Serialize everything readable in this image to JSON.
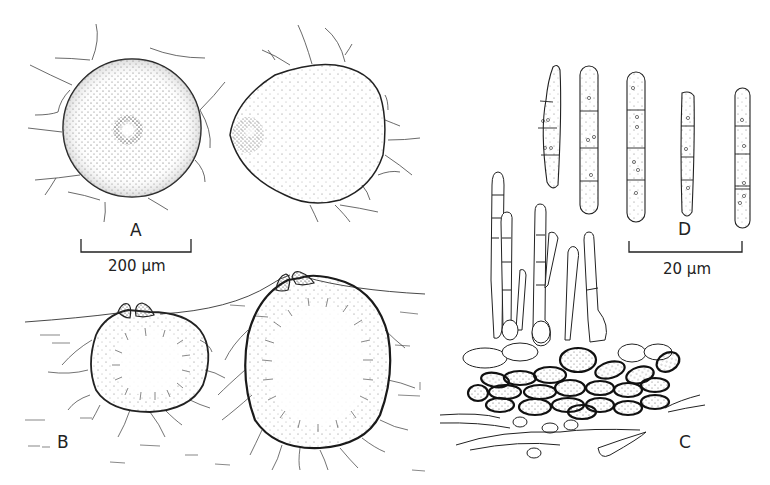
{
  "figure": {
    "panels": [
      {
        "id": "A",
        "label": "A",
        "description": "Two ascomata in surface view, stippled, with radiating hyphae"
      },
      {
        "id": "B",
        "label": "B",
        "description": "Two ascomata in vertical section, immersed in substrate, with apical ostioles"
      },
      {
        "id": "C",
        "label": "C",
        "description": "Ascomatal wall cells with hyphae and paraphyses/asci"
      },
      {
        "id": "D",
        "label": "D",
        "description": "Five septate, cylindrical ascospores with guttules"
      }
    ],
    "scale_bars": [
      {
        "panel": "A",
        "text": "200 µm"
      },
      {
        "panel": "D",
        "text": "20 µm"
      }
    ],
    "colors": {
      "ink": "#222222",
      "background": "#ffffff",
      "stipple": "#444444"
    }
  }
}
